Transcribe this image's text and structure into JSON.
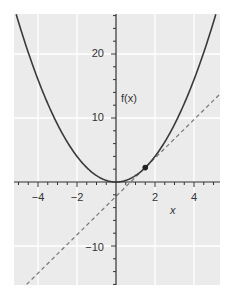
{
  "chart_data": {
    "type": "line",
    "title": "",
    "xlabel": "x",
    "ylabel": "f(x)",
    "xlim": [
      -5.2,
      5.3
    ],
    "ylim": [
      -16,
      26.2
    ],
    "grid": true,
    "x_ticks": [
      -4,
      -2,
      2,
      4
    ],
    "x_tick_labels": [
      "−4",
      "−2",
      "2",
      "4"
    ],
    "y_ticks": [
      20,
      10,
      -10
    ],
    "y_tick_labels": [
      "20",
      "10",
      "−10"
    ],
    "series": [
      {
        "name": "f(x) = x^2",
        "style": "solid",
        "color": "#3a3a3a",
        "function": "x^2"
      },
      {
        "name": "tangent at x = 1.5",
        "style": "dashed",
        "color": "#777777",
        "function": "3x - 2.25"
      }
    ],
    "points": [
      {
        "x": 1.5,
        "y": 2.25,
        "label": ""
      }
    ],
    "colors": {
      "background": "#ebebeb",
      "grid": "#ffffff",
      "axis": "#333333"
    }
  },
  "labels": {
    "x_axis": "x",
    "y_axis": "f(x)",
    "x_ticks": [
      "−4",
      "−2",
      "2",
      "4"
    ],
    "y_ticks": [
      "20",
      "10",
      "−10"
    ]
  }
}
